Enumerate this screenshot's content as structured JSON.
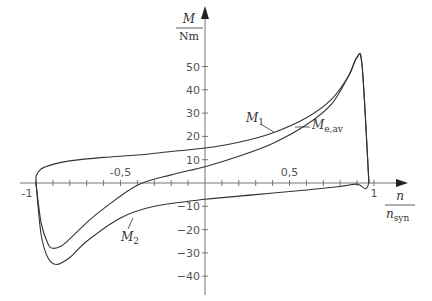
{
  "chart_data": {
    "type": "line",
    "title": "",
    "xlabel": "n / n_syn",
    "ylabel": "M / Nm",
    "xlim": [
      -1,
      1
    ],
    "ylim": [
      -40,
      55
    ],
    "grid": false,
    "x_ticks": [
      "-1",
      "-0,5",
      "0,5",
      "1"
    ],
    "y_ticks": [
      "50",
      "40",
      "30",
      "20",
      "10",
      "-10",
      "-20",
      "-30",
      "-40"
    ],
    "series": [
      {
        "name": "M1",
        "x": [
          -1.0,
          -0.97,
          -0.9,
          -0.8,
          -0.6,
          -0.4,
          -0.2,
          0.0,
          0.2,
          0.4,
          0.6,
          0.75,
          0.85,
          0.9,
          0.93,
          0.97
        ],
        "y": [
          3,
          6,
          8,
          9.5,
          11,
          12,
          13.5,
          15,
          17.5,
          21.5,
          28,
          36,
          46,
          54,
          50,
          0
        ]
      },
      {
        "name": "Me,av",
        "x": [
          -1.0,
          -0.97,
          -0.93,
          -0.9,
          -0.85,
          -0.8,
          -0.7,
          -0.6,
          -0.4,
          -0.2,
          0.0,
          0.2,
          0.4,
          0.6,
          0.75,
          0.85,
          0.9,
          0.93,
          0.97
        ],
        "y": [
          0,
          -17,
          -26,
          -28,
          -27,
          -24,
          -17,
          -11,
          -1,
          3.5,
          7,
          11.5,
          17,
          25,
          34,
          46,
          54,
          50,
          0
        ]
      },
      {
        "name": "M2",
        "x": [
          -1.0,
          -0.97,
          -0.93,
          -0.88,
          -0.8,
          -0.7,
          -0.5,
          -0.3,
          0.0,
          0.3,
          0.6,
          0.8,
          0.9,
          0.95,
          0.97
        ],
        "y": [
          0,
          -22,
          -32,
          -35,
          -32,
          -25,
          -15,
          -10,
          -7,
          -5,
          -3,
          -1.5,
          -0.5,
          -2.5,
          0
        ]
      }
    ],
    "annotations": [
      "M1",
      "Me,av",
      "M2"
    ]
  },
  "axes": {
    "y_label_num": "M",
    "y_label_den": "Nm",
    "x_label_num": "n",
    "x_label_den": "n",
    "x_label_den_sub": "syn"
  },
  "labels": {
    "m1_main": "M",
    "m1_sub": "1",
    "meav_main": "M",
    "meav_sub": "e,av",
    "m2_main": "M",
    "m2_sub": "2"
  }
}
